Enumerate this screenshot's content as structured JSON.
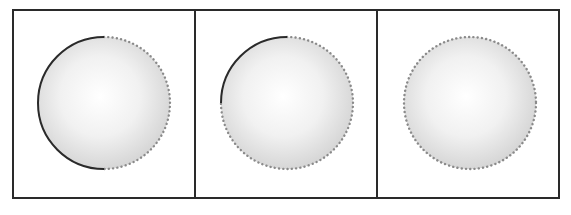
{
  "figure": {
    "panel_count": 3,
    "colors": {
      "border": "#2a2a2a",
      "arc": "#2a2a2a",
      "dots": "#8a8a8a",
      "sphere_highlight": "#ffffff",
      "sphere_edge": "#d6d6d6"
    },
    "panels": [
      {
        "id": "panel-1",
        "cx": 104,
        "cy": 103,
        "r": 66,
        "solid_arc": "top-to-bottom-left-half"
      },
      {
        "id": "panel-2",
        "cx": 287,
        "cy": 103,
        "r": 66,
        "solid_arc": "top-to-left-quarter"
      },
      {
        "id": "panel-3",
        "cx": 470,
        "cy": 103,
        "r": 66,
        "solid_arc": "none"
      }
    ]
  }
}
